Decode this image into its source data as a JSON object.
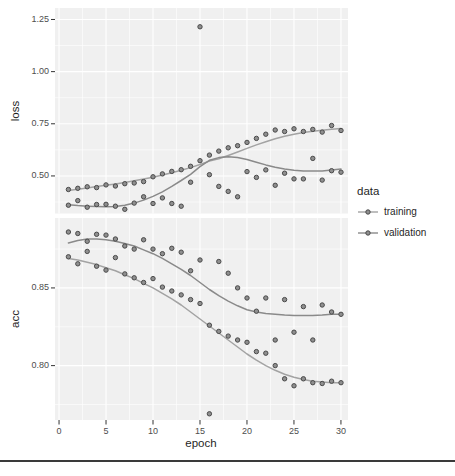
{
  "figure": {
    "bg": "#ffffff",
    "panel_bg": "#f0f0f0",
    "grid_color": "#ffffff",
    "tick_mark_color": "#333333",
    "tick_label_color": "#4d4d4d",
    "title_color": "#1f1f1f",
    "point_fill": "#8f8f8f",
    "point_stroke": "#4a4a4a",
    "separator_color": "#3a3a3a"
  },
  "axes": {
    "x": {
      "title": "epoch",
      "tick_values": [
        0,
        5,
        10,
        15,
        20,
        25,
        30
      ],
      "tick_labels": [
        "0",
        "5",
        "10",
        "15",
        "20",
        "25",
        "30"
      ],
      "minor": [
        2.5,
        7.5,
        12.5,
        17.5,
        22.5,
        27.5
      ],
      "xlim": [
        -0.43,
        30.75
      ]
    },
    "panels": [
      {
        "name": "loss",
        "title": "loss",
        "tick_values": [
          1.25,
          1.0,
          0.75,
          0.5
        ],
        "tick_labels": [
          "1.25",
          "1.00",
          "0.75",
          "0.50"
        ],
        "minor": [
          1.125,
          0.875,
          0.625,
          0.375
        ],
        "ylim": [
          0.32,
          1.305
        ]
      },
      {
        "name": "acc",
        "title": "acc",
        "tick_values": [
          0.85,
          0.8
        ],
        "tick_labels": [
          "0.85",
          "0.80"
        ],
        "minor": [
          0.875,
          0.825,
          0.775
        ],
        "ylim": [
          0.765,
          0.895
        ]
      }
    ]
  },
  "legend": {
    "title": "data",
    "items": [
      {
        "label": "training",
        "color": "#a3a3a3"
      },
      {
        "label": "validation",
        "color": "#8a8a8a"
      }
    ]
  },
  "chart_data": [
    {
      "type": "scatter",
      "panel": "loss",
      "title": "",
      "xlabel": "epoch",
      "ylabel": "loss",
      "ylim": [
        0.32,
        1.305
      ],
      "grid": true,
      "legend_position": "right",
      "x": [
        1,
        2,
        3,
        4,
        5,
        6,
        7,
        8,
        9,
        10,
        11,
        12,
        13,
        14,
        15,
        16,
        17,
        18,
        19,
        20,
        21,
        22,
        23,
        24,
        25,
        26,
        27,
        28,
        29,
        30
      ],
      "series": [
        {
          "name": "training",
          "color": "#a3a3a3",
          "points": [
            0.435,
            0.441,
            0.448,
            0.444,
            0.457,
            0.452,
            0.463,
            0.466,
            0.473,
            0.496,
            0.51,
            0.522,
            0.53,
            0.546,
            0.573,
            0.6,
            0.619,
            0.635,
            0.645,
            0.661,
            0.68,
            0.7,
            0.72,
            0.713,
            0.726,
            0.713,
            0.723,
            0.71,
            0.742,
            0.718
          ],
          "smooth": [
            0.43,
            0.436,
            0.442,
            0.449,
            0.455,
            0.462,
            0.469,
            0.477,
            0.485,
            0.494,
            0.504,
            0.515,
            0.527,
            0.54,
            0.555,
            0.571,
            0.582,
            0.598,
            0.615,
            0.632,
            0.649,
            0.664,
            0.678,
            0.69,
            0.7,
            0.708,
            0.714,
            0.719,
            0.724,
            0.728
          ]
        },
        {
          "name": "validation",
          "color": "#8a8a8a",
          "points": [
            0.36,
            0.382,
            0.35,
            0.363,
            0.364,
            0.355,
            0.34,
            0.37,
            0.4,
            0.368,
            0.395,
            0.368,
            0.355,
            0.47,
            1.215,
            0.506,
            0.45,
            0.426,
            0.4,
            0.521,
            0.493,
            0.529,
            0.455,
            0.513,
            0.486,
            0.486,
            0.584,
            0.48,
            0.525,
            0.518
          ],
          "smooth": [
            0.362,
            0.358,
            0.355,
            0.353,
            0.352,
            0.354,
            0.36,
            0.37,
            0.384,
            0.402,
            0.424,
            0.45,
            0.478,
            0.508,
            0.545,
            0.575,
            0.588,
            0.592,
            0.589,
            0.579,
            0.566,
            0.553,
            0.542,
            0.533,
            0.527,
            0.524,
            0.523,
            0.524,
            0.528,
            0.533
          ]
        }
      ]
    },
    {
      "type": "scatter",
      "panel": "acc",
      "title": "",
      "xlabel": "epoch",
      "ylabel": "acc",
      "ylim": [
        0.765,
        0.895
      ],
      "grid": true,
      "legend_position": "right",
      "x": [
        1,
        2,
        3,
        4,
        5,
        6,
        7,
        8,
        9,
        10,
        11,
        12,
        13,
        14,
        15,
        16,
        17,
        18,
        19,
        20,
        21,
        22,
        23,
        24,
        25,
        26,
        27,
        28,
        29,
        30
      ],
      "series": [
        {
          "name": "training",
          "color": "#a3a3a3",
          "points": [
            0.87,
            0.8655,
            0.8735,
            0.864,
            0.8615,
            0.8695,
            0.859,
            0.8565,
            0.8535,
            0.856,
            0.8505,
            0.848,
            0.8455,
            0.8425,
            0.84,
            0.826,
            0.822,
            0.819,
            0.8165,
            0.815,
            0.809,
            0.808,
            0.8,
            0.7915,
            0.787,
            0.7915,
            0.789,
            0.7885,
            0.79,
            0.789
          ],
          "smooth": [
            0.869,
            0.868,
            0.8665,
            0.865,
            0.863,
            0.861,
            0.8585,
            0.856,
            0.853,
            0.85,
            0.8465,
            0.843,
            0.839,
            0.8345,
            0.83,
            0.8255,
            0.821,
            0.8165,
            0.812,
            0.8075,
            0.8035,
            0.8,
            0.797,
            0.7945,
            0.7925,
            0.791,
            0.79,
            0.7895,
            0.789,
            0.789
          ]
        },
        {
          "name": "validation",
          "color": "#8a8a8a",
          "points": [
            0.886,
            0.885,
            0.88,
            0.8845,
            0.884,
            0.8815,
            0.877,
            0.875,
            0.881,
            0.875,
            0.872,
            0.8755,
            0.873,
            0.861,
            0.868,
            0.769,
            0.867,
            0.8595,
            0.85,
            0.8435,
            0.835,
            0.8435,
            0.8165,
            0.8425,
            0.8215,
            0.838,
            0.8165,
            0.839,
            0.8345,
            0.833
          ],
          "smooth": [
            0.879,
            0.8805,
            0.8815,
            0.8815,
            0.881,
            0.88,
            0.8785,
            0.877,
            0.8745,
            0.872,
            0.869,
            0.8655,
            0.862,
            0.858,
            0.8535,
            0.849,
            0.845,
            0.8415,
            0.8385,
            0.836,
            0.8345,
            0.8335,
            0.833,
            0.8325,
            0.8323,
            0.8322,
            0.8322,
            0.8325,
            0.833,
            0.833
          ]
        }
      ]
    }
  ]
}
